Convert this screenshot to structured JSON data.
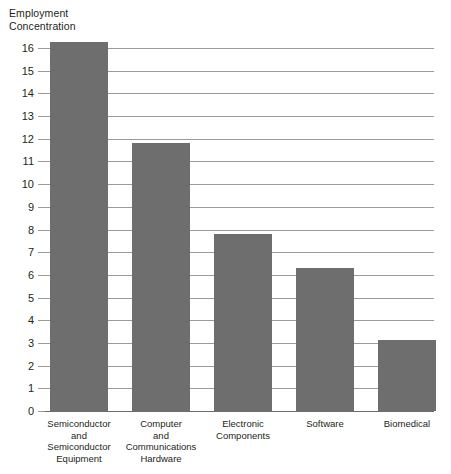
{
  "chart_data": {
    "type": "bar",
    "title": "Employment\nConcentration",
    "ylabel": "Employment Concentration",
    "xlabel": "",
    "categories": [
      "Semiconductor\nand\nSemiconductor\nEquipment",
      "Computer\nand\nCommunications\nHardware",
      "Electronic\nComponents",
      "Software",
      "Biomedical"
    ],
    "values": [
      16.25,
      11.8,
      7.8,
      6.3,
      3.15
    ],
    "ylim": [
      0,
      16
    ],
    "yticks": [
      0,
      1,
      2,
      3,
      4,
      5,
      6,
      7,
      8,
      9,
      10,
      11,
      12,
      13,
      14,
      15,
      16
    ],
    "ytick_labels": [
      "0",
      "1",
      "2",
      "3",
      "4",
      "5",
      "6",
      "7",
      "8",
      "9",
      "10",
      "11",
      "12",
      "13",
      "14",
      "15",
      "16"
    ],
    "grid": true,
    "legend": null,
    "bar_color": "#6e6e6e",
    "gridline_color": "#9a9a9a",
    "axis_color": "#6d6d6d",
    "background_color": "#ffffff",
    "text_color": "#231f20"
  }
}
